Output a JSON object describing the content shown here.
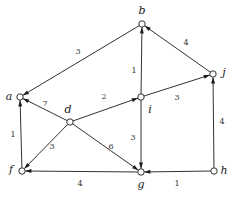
{
  "figure": {
    "name": "weighted-directed-graph",
    "background_color": "#ffffff",
    "stroke_color": "#1a1a1a",
    "label_color": "#333333"
  },
  "chart_data": {
    "type": "diagram",
    "title": "",
    "xlabel": "",
    "ylabel": "",
    "graph_kind": "weighted directed graph",
    "directed": true,
    "node_count": 8,
    "edge_count": 13,
    "nodes": [
      {
        "id": "a",
        "label": "a",
        "x": 20,
        "y": 97,
        "label_x": 9,
        "label_y": 97
      },
      {
        "id": "b",
        "label": "b",
        "x": 142,
        "y": 24,
        "label_x": 142,
        "label_y": 11
      },
      {
        "id": "d",
        "label": "d",
        "x": 70,
        "y": 122,
        "label_x": 68,
        "label_y": 110
      },
      {
        "id": "f",
        "label": "f",
        "x": 22,
        "y": 171,
        "label_x": 11,
        "label_y": 170
      },
      {
        "id": "g",
        "label": "g",
        "x": 141,
        "y": 172,
        "label_x": 141,
        "label_y": 185
      },
      {
        "id": "h",
        "label": "h",
        "x": 214,
        "y": 171,
        "label_x": 224,
        "label_y": 171
      },
      {
        "id": "i",
        "label": "i",
        "x": 141,
        "y": 97,
        "label_x": 150,
        "label_y": 110
      },
      {
        "id": "j",
        "label": "j",
        "x": 213,
        "y": 74,
        "label_x": 224,
        "label_y": 73
      }
    ],
    "edges": [
      {
        "from": "b",
        "to": "a",
        "weight": "3",
        "label_x": 78,
        "label_y": 52
      },
      {
        "from": "i",
        "to": "b",
        "weight": "1",
        "label_x": 134,
        "label_y": 71
      },
      {
        "from": "j",
        "to": "b",
        "weight": "4",
        "label_x": 186,
        "label_y": 43
      },
      {
        "from": "d",
        "to": "a",
        "weight": "7",
        "label_x": 45,
        "label_y": 104
      },
      {
        "from": "d",
        "to": "i",
        "weight": "2",
        "label_x": 104,
        "label_y": 97
      },
      {
        "from": "i",
        "to": "j",
        "weight": "3",
        "label_x": 177,
        "label_y": 98
      },
      {
        "from": "f",
        "to": "a",
        "weight": "1",
        "label_x": 13,
        "label_y": 135
      },
      {
        "from": "d",
        "to": "f",
        "weight": "3",
        "label_x": 52,
        "label_y": 147
      },
      {
        "from": "d",
        "to": "g",
        "weight": "6",
        "label_x": 111,
        "label_y": 147
      },
      {
        "from": "i",
        "to": "g",
        "weight": "3",
        "label_x": 133,
        "label_y": 138
      },
      {
        "from": "h",
        "to": "j",
        "weight": "4",
        "label_x": 222,
        "label_y": 122
      },
      {
        "from": "g",
        "to": "f",
        "weight": "4",
        "label_x": 80,
        "label_y": 184
      },
      {
        "from": "h",
        "to": "g",
        "weight": "1",
        "label_x": 177,
        "label_y": 184
      }
    ]
  }
}
